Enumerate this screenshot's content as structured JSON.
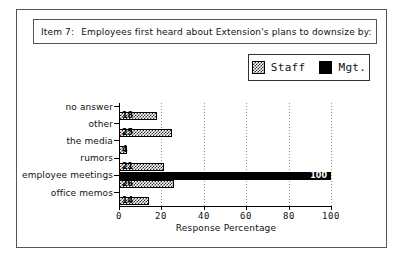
{
  "title": {
    "item": "Item 7:",
    "text": "Employees first heard about Extension's plans to downsize by:"
  },
  "legend": {
    "entries": [
      {
        "label": "Staff",
        "swatch": "checkered-swatch",
        "color": "#2f2f2f"
      },
      {
        "label": "Mgt.",
        "swatch": "solid-black-swatch",
        "color": "#000000"
      }
    ]
  },
  "chart_data": {
    "type": "bar",
    "orientation": "horizontal",
    "xlabel": "Response Percentage",
    "ylabel": "",
    "xlim": [
      0,
      100
    ],
    "xticks": [
      0,
      20,
      40,
      60,
      80,
      100
    ],
    "xticklabels": [
      "0",
      "20",
      "40",
      "60",
      "80",
      "100"
    ],
    "grid": true,
    "legend_position": "upper right",
    "categories": [
      "no answer",
      "other",
      "the media",
      "rumors",
      "employee meetings",
      "office memos"
    ],
    "series": [
      {
        "name": "Staff",
        "values": [
          18,
          25,
          4,
          21,
          26,
          14
        ],
        "labels": [
          "18",
          "25",
          "4",
          "21",
          "26",
          "14"
        ]
      },
      {
        "name": "Mgt.",
        "values": [
          0,
          0,
          0,
          0,
          100,
          0
        ],
        "labels": [
          "",
          "",
          "",
          "",
          "100",
          ""
        ]
      }
    ]
  }
}
